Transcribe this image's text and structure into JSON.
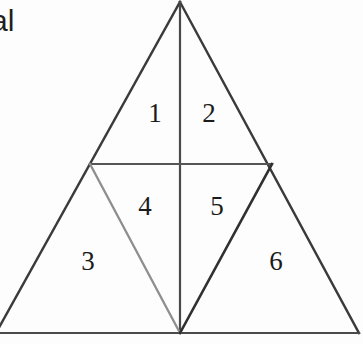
{
  "figure": {
    "kind": "geometric-diagram",
    "canvas": {
      "width": 363,
      "height": 344
    },
    "background_color": "#fdfdfd",
    "cropped_text": "al",
    "stroke_colors": {
      "outline": "#3a3a3a",
      "midline": "#555555",
      "vertical": "#4a4a4a",
      "light_diagonal": "#8e8e8e",
      "dark_diagonal": "#303030",
      "baseline": "#4a4a4a"
    },
    "label_color": "#1b1b1b",
    "vertices": {
      "apex": {
        "x": 180,
        "y": 2
      },
      "left_base": {
        "x": -4,
        "y": 333
      },
      "right_base": {
        "x": 359,
        "y": 333
      },
      "left_midpoint": {
        "x": 90,
        "y": 164
      },
      "right_midpoint": {
        "x": 272,
        "y": 164
      },
      "base_midpoint": {
        "x": 180,
        "y": 333
      },
      "center": {
        "x": 180,
        "y": 164
      }
    },
    "segments": [
      {
        "name": "left-outer-edge",
        "from": "apex",
        "to": "left_base",
        "color": "#3a3a3a",
        "width": 2.4
      },
      {
        "name": "right-outer-edge",
        "from": "apex",
        "to": "right_base",
        "color": "#3a3a3a",
        "width": 2.4
      },
      {
        "name": "base-line",
        "from": "left_base",
        "to": "right_base",
        "color": "#4a4a4a",
        "width": 2.2
      },
      {
        "name": "vertical-median",
        "from": "apex",
        "to": "base_midpoint",
        "color": "#4a4a4a",
        "width": 2.2
      },
      {
        "name": "horizontal-midline",
        "from": "left_midpoint",
        "to": "right_midpoint",
        "color": "#555555",
        "width": 2.2
      },
      {
        "name": "left-diagonal",
        "from": "left_midpoint",
        "to": "base_midpoint",
        "color": "#8e8e8e",
        "width": 2.3
      },
      {
        "name": "right-diagonal",
        "from": "base_midpoint",
        "to": "right_midpoint",
        "color": "#303030",
        "width": 2.6
      }
    ],
    "regions": [
      {
        "id": "region-1",
        "label": "1",
        "x": 155,
        "y": 113
      },
      {
        "id": "region-2",
        "label": "2",
        "x": 209,
        "y": 113
      },
      {
        "id": "region-3",
        "label": "3",
        "x": 88,
        "y": 261
      },
      {
        "id": "region-4",
        "label": "4",
        "x": 145,
        "y": 206
      },
      {
        "id": "region-5",
        "label": "5",
        "x": 217,
        "y": 206
      },
      {
        "id": "region-6",
        "label": "6",
        "x": 276,
        "y": 261
      }
    ]
  }
}
